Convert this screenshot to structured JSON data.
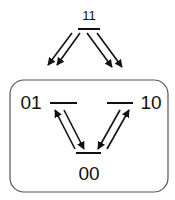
{
  "diagram": {
    "states": [
      {
        "id": "s11",
        "label": "11",
        "bar": [
          78,
          29,
          100,
          29
        ],
        "text_pos": [
          89,
          20
        ],
        "font_size": 13
      },
      {
        "id": "s01",
        "label": "01",
        "bar": [
          50,
          103,
          77,
          103
        ],
        "text_pos": [
          31,
          109
        ],
        "font_size": 19
      },
      {
        "id": "s10",
        "label": "10",
        "bar": [
          107,
          103,
          133,
          103
        ],
        "text_pos": [
          151,
          109
        ],
        "font_size": 19
      },
      {
        "id": "s00",
        "label": "00",
        "bar": [
          76,
          153,
          101,
          153
        ],
        "text_pos": [
          89,
          180
        ],
        "font_size": 19
      }
    ],
    "transitions": [
      {
        "from": "11",
        "to": "01",
        "line": [
          72,
          33,
          48,
          65
        ]
      },
      {
        "from": "11",
        "to": "01",
        "line": [
          80,
          33,
          57,
          65
        ]
      },
      {
        "from": "11",
        "to": "10",
        "line": [
          87,
          33,
          112,
          67
        ]
      },
      {
        "from": "11",
        "to": "10",
        "line": [
          97,
          33,
          122,
          67
        ]
      },
      {
        "from": "00",
        "to": "01",
        "line": [
          75,
          149,
          55,
          110
        ]
      },
      {
        "from": "01",
        "to": "00",
        "line": [
          64,
          110,
          84,
          149
        ]
      },
      {
        "from": "10",
        "to": "00",
        "line": [
          120,
          110,
          98,
          149
        ]
      },
      {
        "from": "00",
        "to": "10",
        "line": [
          107,
          149,
          129,
          110
        ]
      }
    ],
    "group_box": {
      "x": 10,
      "y": 80,
      "width": 158,
      "height": 112,
      "radius": 14
    },
    "colors": {
      "stroke": "#111111",
      "box": "#555555",
      "background": "#ffffff"
    }
  }
}
